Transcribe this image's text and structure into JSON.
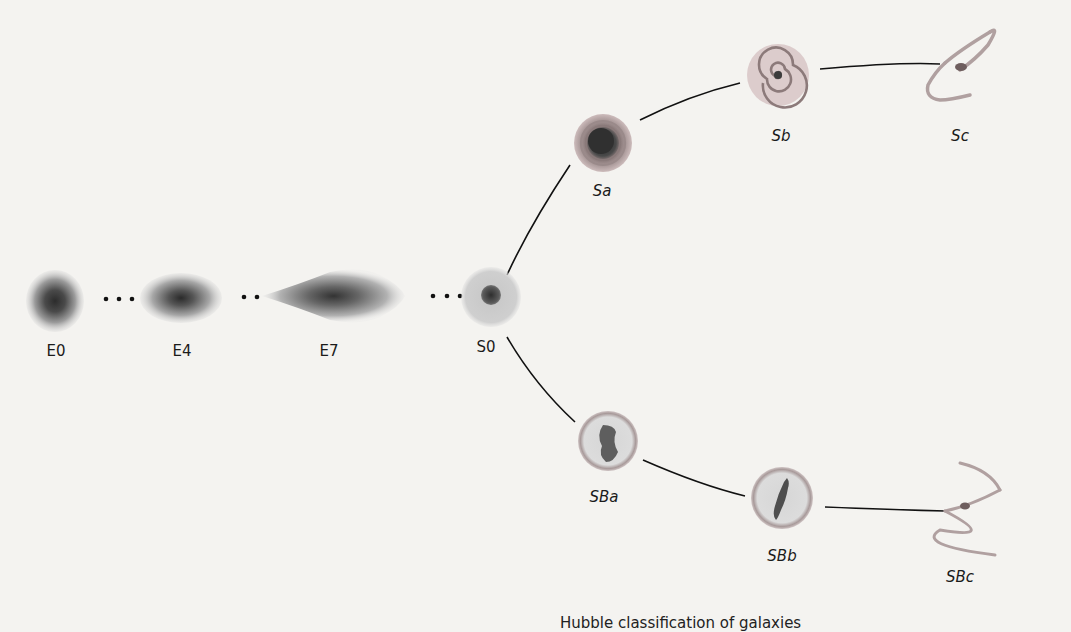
{
  "diagram": {
    "title": "Hubble classification of galaxies",
    "elliptical_sequence": [
      {
        "id": "E0",
        "label": "E0"
      },
      {
        "id": "E4",
        "label": "E4"
      },
      {
        "id": "E7",
        "label": "E7"
      },
      {
        "id": "S0",
        "label": "S0"
      }
    ],
    "spiral_branch": [
      {
        "id": "Sa",
        "label": "Sa"
      },
      {
        "id": "Sb",
        "label": "Sb"
      },
      {
        "id": "Sc",
        "label": "Sc"
      }
    ],
    "barred_spiral_branch": [
      {
        "id": "SBa",
        "label": "SBa"
      },
      {
        "id": "SBb",
        "label": "SBb"
      },
      {
        "id": "SBc",
        "label": "SBc"
      }
    ],
    "separators": [
      "• • •",
      "• •",
      "• • •"
    ],
    "colors": {
      "background": "#f4f3f0",
      "galaxy_core": "#3a3a3a",
      "galaxy_halo": "#b8b8b8",
      "spiral_arm": "#a58e8e",
      "connector": "#111111"
    }
  }
}
